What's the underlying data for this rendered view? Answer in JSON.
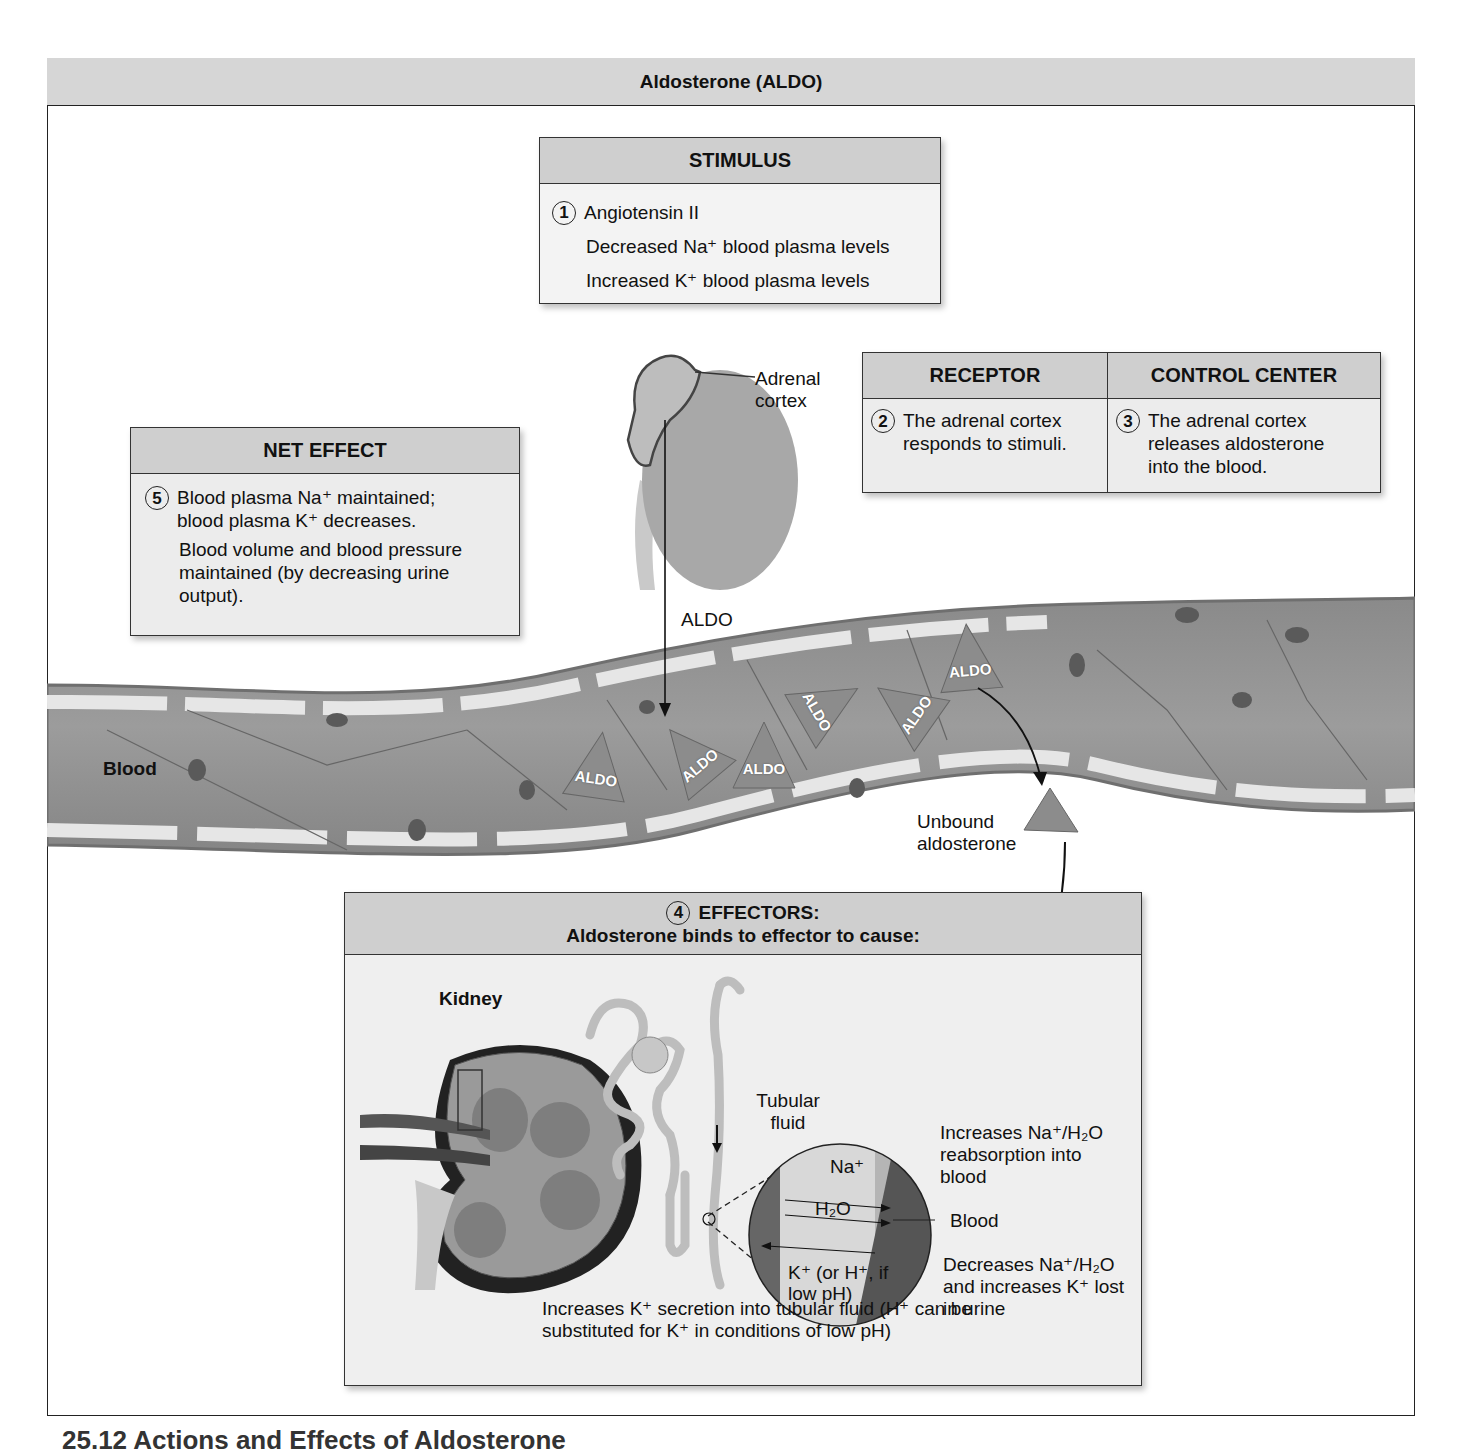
{
  "title": "Aldosterone (ALDO)",
  "stimulus": {
    "heading": "STIMULUS",
    "number": "1",
    "items": [
      "Angiotensin II",
      "Decreased Na⁺ blood plasma levels",
      "Increased K⁺ blood plasma levels"
    ]
  },
  "receptor": {
    "heading": "RECEPTOR",
    "number": "2",
    "text": "The adrenal cortex responds to stimuli."
  },
  "control_center": {
    "heading": "CONTROL CENTER",
    "number": "3",
    "text": "The adrenal cortex releases aldosterone into the blood."
  },
  "net_effect": {
    "heading": "NET EFFECT",
    "number": "5",
    "items": [
      "Blood plasma Na⁺ maintained; blood plasma K⁺ decreases.",
      "Blood volume and blood pressure maintained (by decreasing urine output)."
    ]
  },
  "effectors": {
    "number": "4",
    "heading_line1": "EFFECTORS:",
    "heading_line2": "Aldosterone binds to effector to cause:",
    "kidney_label": "Kidney",
    "tubular_fluid_label": "Tubular fluid",
    "blood_label": "Blood",
    "na_label": "Na⁺",
    "h2o_label": "H₂O",
    "k_label": "K⁺ (or H⁺, if low pH)",
    "increases_na_text": "Increases Na⁺/H₂O reabsorption into blood",
    "decreases_na_text": "Decreases Na⁺/H₂O and increases K⁺ lost in urine",
    "k_secretion_text": "Increases K⁺ secretion into tubular fluid (H⁺ can be substituted for K⁺ in conditions of low pH)"
  },
  "illustration": {
    "adrenal_cortex_label": "Adrenal cortex",
    "aldo_arrow_label": "ALDO",
    "blood_label": "Blood",
    "hormone_label": "ALDO",
    "unbound_label": "Unbound aldosterone"
  },
  "caption": "25.12 Actions and Effects of Aldosterone"
}
